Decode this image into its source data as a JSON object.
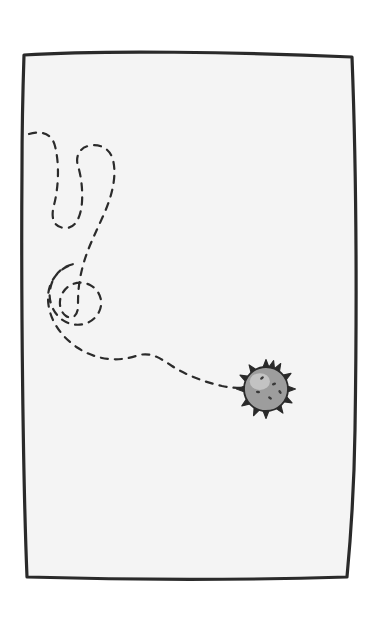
{
  "scene": {
    "title": "Dashed wandering trail ending at a spiky germ",
    "width": 381,
    "height": 618,
    "outer_background": "#ffffff",
    "paper_background": "#f4f4f4",
    "ink_color": "#2a2a2a"
  },
  "frame": {
    "label": "hand-drawn rectangular border",
    "stroke_color": "#2a2a2a",
    "stroke_width": 3.2,
    "corners": {
      "top_left": [
        24,
        54
      ],
      "top_right": [
        353,
        58
      ],
      "bottom_right": [
        347,
        578
      ],
      "bottom_left": [
        26,
        577
      ]
    },
    "path": "M 24,55 C 100,50 240,52 352,57 C 356,160 357,300 355,430 C 354,500 350,545 347,577 C 250,580 130,580 27,577 C 23,480 21,300 22,170 C 22,120 23,85 24,55 Z"
  },
  "trail": {
    "label": "dashed meandering path",
    "stroke_color": "#2b2b2b",
    "stroke_width": 2.2,
    "dash_pattern": "7 7",
    "start_point": [
      30,
      135
    ],
    "end_point": [
      245,
      388
    ],
    "loop_count": 3,
    "path": "M 29,134 C 42,130 52,134 55,146 C 60,166 58,190 54,205 C 50,220 55,228 66,228 C 76,228 81,216 82,202 C 83,186 80,172 78,166 C 75,156 80,148 88,146 C 99,143 110,148 113,160 C 117,176 112,196 104,214 C 96,232 88,248 84,262 C 78,282 78,296 78,306 C 78,316 72,320 66,316 C 60,312 58,302 62,294 C 68,283 80,280 90,285 C 100,290 104,302 99,312 C 93,324 78,328 66,322 C 54,316 48,302 50,290 C 52,276 62,266 74,264 C 58,268 48,282 48,298 C 48,318 60,336 78,348 C 96,360 118,362 136,356 C 150,351 160,358 172,366 C 186,375 204,382 222,386 C 232,388 240,388 246,388"
  },
  "germ": {
    "label": "spiky germ blob",
    "center": [
      266,
      389
    ],
    "radius": 22,
    "body_color": "#9d9d9d",
    "outline_color": "#2a2a2a",
    "highlight_color": "#c3c3c3",
    "speck_color": "#3a3a3a",
    "spike_count": 13,
    "speck_count": 5,
    "specks": [
      [
        262,
        378
      ],
      [
        274,
        384
      ],
      [
        258,
        392
      ],
      [
        270,
        398
      ],
      [
        280,
        392
      ]
    ],
    "spikes": [
      [
        265,
        367,
        90
      ],
      [
        277,
        369,
        60
      ],
      [
        285,
        377,
        32
      ],
      [
        288,
        389,
        0
      ],
      [
        286,
        400,
        -28
      ],
      [
        278,
        408,
        -55
      ],
      [
        267,
        411,
        -90
      ],
      [
        256,
        409,
        -115
      ],
      [
        248,
        402,
        -145
      ],
      [
        245,
        390,
        180
      ],
      [
        246,
        379,
        152
      ],
      [
        253,
        371,
        125
      ],
      [
        271,
        364,
        75
      ]
    ]
  }
}
